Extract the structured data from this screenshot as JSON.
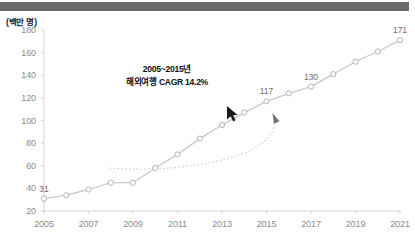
{
  "chart_data": {
    "type": "line",
    "title": "",
    "xlabel": "",
    "ylabel": "(백만 명)",
    "ylim": [
      20,
      180
    ],
    "xlim": [
      2005,
      2021
    ],
    "grid": false,
    "legend": null,
    "ytick_labels": [
      "180",
      "160",
      "140",
      "120",
      "100",
      "80",
      "60",
      "40",
      "20"
    ],
    "ytick_values": [
      180,
      160,
      140,
      120,
      100,
      80,
      60,
      40,
      20
    ],
    "xtick_labels": [
      "2005",
      "2007",
      "2009",
      "2011",
      "2013",
      "2015",
      "2017",
      "2019",
      "2021"
    ],
    "xtick_values": [
      2005,
      2007,
      2009,
      2011,
      2013,
      2015,
      2017,
      2019,
      2021
    ],
    "x": [
      2005,
      2006,
      2007,
      2008,
      2009,
      2010,
      2011,
      2012,
      2013,
      2014,
      2015,
      2016,
      2017,
      2018,
      2019,
      2020,
      2021
    ],
    "series": [
      {
        "name": "해외여행",
        "values": [
          31,
          34,
          39,
          45,
          45,
          58,
          70,
          84,
          96,
          107,
          117,
          124,
          130,
          141,
          152,
          161,
          171
        ],
        "marker": "open-circle",
        "color": "#c9c9c9"
      }
    ],
    "point_labels": [
      {
        "x": 2005,
        "value": 31,
        "text": "31"
      },
      {
        "x": 2015,
        "value": 117,
        "text": "117"
      },
      {
        "x": 2017,
        "value": 130,
        "text": "130"
      },
      {
        "x": 2021,
        "value": 171,
        "text": "171"
      }
    ],
    "annotations": [
      {
        "name": "cagr-callout",
        "line1": "2005~2015년",
        "line2": "해외여행 CAGR 14.2%",
        "points_to": {
          "x": 2015,
          "value": 117
        }
      }
    ]
  },
  "colors": {
    "line": "#c9c9c9",
    "marker_stroke": "#b5b5b5",
    "axis": "#d5d5d5",
    "tick_text": "#8c8c8c",
    "label_text": "#6f6f6f",
    "annotation_text": "#111111",
    "top_bar": "#6b6b6b",
    "bottom_rule": "#d8d8d8",
    "cursor": "#1a1a1a"
  },
  "cursor": {
    "name": "mouse-pointer",
    "visible": true
  }
}
